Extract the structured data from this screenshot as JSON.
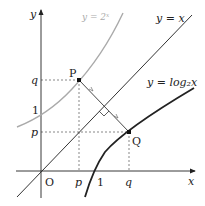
{
  "diagram": {
    "axes": {
      "x_label": "x",
      "y_label": "y",
      "origin_label": "O"
    },
    "curves": {
      "exp_label": "y = 2ˣ",
      "identity_label": "y = x",
      "log_label": "y = log₂x"
    },
    "points": {
      "P_label": "P",
      "Q_label": "Q"
    },
    "ticks": {
      "y_q": "q",
      "y_1": "1",
      "y_p": "p",
      "x_p": "p",
      "x_1": "1",
      "x_q": "q"
    },
    "colors": {
      "axis": "#222222",
      "exp_curve": "#aaaaaa",
      "log_curve": "#222222",
      "identity_line": "#333333"
    }
  }
}
